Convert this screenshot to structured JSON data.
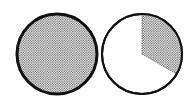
{
  "figure": {
    "circles": [
      {
        "id": "whole",
        "shaded_fraction": 1,
        "cx": 57,
        "cy": 54,
        "r": 40
      },
      {
        "id": "third",
        "shaded_fraction": 0.3333,
        "cx": 142,
        "cy": 54,
        "r": 40,
        "wedge_start_deg": 0,
        "wedge_end_deg": 120
      }
    ],
    "colors": {
      "stroke": "#111111",
      "dot": "#555555",
      "background": "#ffffff"
    }
  }
}
